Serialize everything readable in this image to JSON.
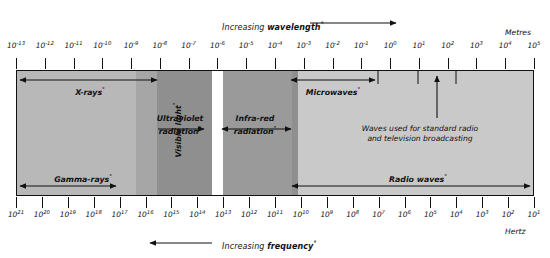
{
  "header": {
    "caption_pre": "Increasing ",
    "caption_bold": "wavelength",
    "caption_deg": "°"
  },
  "footer": {
    "caption_pre": "Increasing ",
    "caption_bold": "frequency",
    "caption_deg": "°"
  },
  "top_axis": {
    "unit_label": "Metres",
    "ticks": [
      {
        "mantissa": "10",
        "exp": "-13"
      },
      {
        "mantissa": "10",
        "exp": "-12"
      },
      {
        "mantissa": "10",
        "exp": "-11"
      },
      {
        "mantissa": "10",
        "exp": "-10"
      },
      {
        "mantissa": "10",
        "exp": "-9"
      },
      {
        "mantissa": "10",
        "exp": "-8"
      },
      {
        "mantissa": "10",
        "exp": "-7"
      },
      {
        "mantissa": "10",
        "exp": "-6"
      },
      {
        "mantissa": "10",
        "exp": "-5"
      },
      {
        "mantissa": "10",
        "exp": "-4"
      },
      {
        "mantissa": "10",
        "exp": "-3"
      },
      {
        "mantissa": "10",
        "exp": "-2"
      },
      {
        "mantissa": "10",
        "exp": "-1"
      },
      {
        "mantissa": "10",
        "exp": "0"
      },
      {
        "mantissa": "10",
        "exp": "1"
      },
      {
        "mantissa": "10",
        "exp": "2"
      },
      {
        "mantissa": "10",
        "exp": "3"
      },
      {
        "mantissa": "10",
        "exp": "4"
      },
      {
        "mantissa": "10",
        "exp": "5"
      }
    ]
  },
  "bottom_axis": {
    "unit_label": "Hertz",
    "ticks": [
      {
        "mantissa": "10",
        "exp": "21"
      },
      {
        "mantissa": "10",
        "exp": "20"
      },
      {
        "mantissa": "10",
        "exp": "19"
      },
      {
        "mantissa": "10",
        "exp": "18"
      },
      {
        "mantissa": "10",
        "exp": "17"
      },
      {
        "mantissa": "10",
        "exp": "16"
      },
      {
        "mantissa": "10",
        "exp": "15"
      },
      {
        "mantissa": "10",
        "exp": "14"
      },
      {
        "mantissa": "10",
        "exp": "13"
      },
      {
        "mantissa": "10",
        "exp": "12"
      },
      {
        "mantissa": "10",
        "exp": "11"
      },
      {
        "mantissa": "10",
        "exp": "10"
      },
      {
        "mantissa": "10",
        "exp": "9"
      },
      {
        "mantissa": "10",
        "exp": "8"
      },
      {
        "mantissa": "10",
        "exp": "7"
      },
      {
        "mantissa": "10",
        "exp": "6"
      },
      {
        "mantissa": "10",
        "exp": "5"
      },
      {
        "mantissa": "10",
        "exp": "4"
      },
      {
        "mantissa": "10",
        "exp": "3"
      },
      {
        "mantissa": "10",
        "exp": "2"
      },
      {
        "mantissa": "10",
        "exp": "1"
      }
    ]
  },
  "bands": [
    {
      "name": "gamma-rays",
      "label": "Gamma-rays",
      "deg": "°",
      "fill": "#a6a6a6"
    },
    {
      "name": "x-rays",
      "label": "X-rays",
      "deg": "°",
      "fill": "#b8b8b8"
    },
    {
      "name": "ultraviolet",
      "label": "Ultraviolet radiation",
      "deg": "°",
      "fill": "#8f8f8f"
    },
    {
      "name": "visible",
      "label": "Visible light",
      "deg": "°",
      "fill": "#ffffff"
    },
    {
      "name": "infra-red",
      "label": "Infra-red radiation",
      "deg": "°",
      "fill": "#9a9a9a"
    },
    {
      "name": "microwaves",
      "label": "Microwaves",
      "deg": "°",
      "fill": "#c4c4c4"
    },
    {
      "name": "radio-waves",
      "label": "Radio waves",
      "deg": "°",
      "fill": "#c9c9c9"
    }
  ],
  "band_labels": {
    "gamma": {
      "text": "Gamma-rays",
      "deg": "°"
    },
    "xrays": {
      "text": "X-rays",
      "deg": "°"
    },
    "uv_line1": {
      "text": "Ultraviolet"
    },
    "uv_line2": {
      "text": "radiation",
      "deg": "°"
    },
    "visible": {
      "text": "Visible light",
      "deg": "°"
    },
    "ir_line1": {
      "text": "Infra-red"
    },
    "ir_line2": {
      "text": "radiation",
      "deg": "°"
    },
    "microwaves": {
      "text": "Microwaves",
      "deg": "°"
    },
    "radio": {
      "text": "Radio waves",
      "deg": "°"
    }
  },
  "annotation": {
    "line1": "Waves used for standard radio",
    "line2": "and television broadcasting"
  },
  "colors": {
    "stroke": "#111111",
    "page_bg": "#ffffff"
  }
}
